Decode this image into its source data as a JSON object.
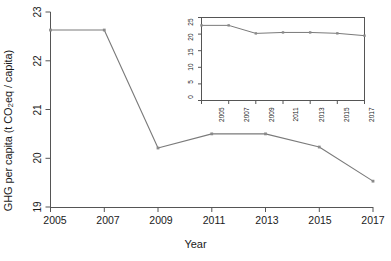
{
  "chart_data": {
    "type": "line",
    "title": "",
    "xlabel": "Year",
    "ylabel": "GHG per capita (t CO2 eq / capita)",
    "ylabel_parts": {
      "before": "GHG per capita (t CO",
      "sub": "2",
      "after": " eq / capita)"
    },
    "x": [
      2005,
      2007,
      2009,
      2011,
      2013,
      2015,
      2017
    ],
    "categories": [
      "2005",
      "2007",
      "2009",
      "2011",
      "2013",
      "2015",
      "2017"
    ],
    "values": [
      22.63,
      22.63,
      20.21,
      20.5,
      20.5,
      20.23,
      19.53
    ],
    "series": [
      {
        "name": "GHG per capita",
        "values": [
          22.63,
          22.63,
          20.21,
          20.5,
          20.5,
          20.23,
          19.53
        ]
      }
    ],
    "xlim": [
      2005,
      2017
    ],
    "ylim": [
      19,
      23
    ],
    "xticks": [
      2005,
      2007,
      2009,
      2011,
      2013,
      2015,
      2017
    ],
    "xtick_labels": [
      "2005",
      "2007",
      "2009",
      "2011",
      "2013",
      "2015",
      "2017"
    ],
    "yticks": [
      19,
      20,
      21,
      22,
      23
    ],
    "ytick_labels": [
      "19",
      "20",
      "21",
      "22",
      "23"
    ],
    "grid": false,
    "legend": "none",
    "line_color": "#7a7a7a",
    "marker": "point",
    "inset": {
      "type": "line",
      "x": [
        2005,
        2007,
        2009,
        2011,
        2013,
        2015,
        2017
      ],
      "categories": [
        "2005",
        "2007",
        "2009",
        "2011",
        "2013",
        "2015",
        "2017"
      ],
      "values": [
        22.63,
        22.63,
        20.21,
        20.5,
        20.5,
        20.23,
        19.53
      ],
      "series": [
        {
          "name": "GHG per capita",
          "values": [
            22.63,
            22.63,
            20.21,
            20.5,
            20.5,
            20.23,
            19.53
          ]
        }
      ],
      "xlim": [
        2005,
        2017
      ],
      "ylim": [
        0,
        25
      ],
      "xticks": [
        2005,
        2007,
        2009,
        2011,
        2013,
        2015,
        2017
      ],
      "xtick_labels": [
        "2005",
        "2007",
        "2009",
        "2011",
        "2013",
        "2015",
        "2017"
      ],
      "yticks": [
        0,
        5,
        10,
        15,
        20,
        25
      ],
      "ytick_labels": [
        "0",
        "5",
        "10",
        "15",
        "20",
        "25"
      ],
      "grid": false,
      "legend": "none",
      "xlabel": "",
      "ylabel": "",
      "line_color": "#7a7a7a"
    }
  },
  "colors": {
    "background": "#ffffff",
    "axis": "#555555",
    "line": "#7a7a7a",
    "text": "#1a1a1a"
  }
}
